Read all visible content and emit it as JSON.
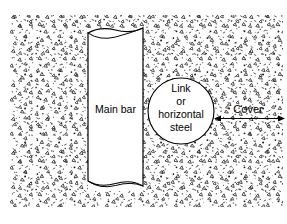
{
  "figure": {
    "type": "engineering-cross-section",
    "background_color": "#ffffff",
    "concrete": {
      "name": "concrete-hatch-region",
      "fill_color": "#ffffff",
      "speck_color": "#1a1a1a",
      "bounds": {
        "x": 10,
        "y": 15,
        "width": 273,
        "height": 192
      }
    },
    "main_bar": {
      "label": "Main bar",
      "fill_color": "#ffffff",
      "stroke_color": "#000000",
      "bounds": {
        "x": 88,
        "y": 28,
        "width": 55,
        "height": 163
      },
      "label_position": {
        "x": 116,
        "y": 109
      }
    },
    "link_steel": {
      "label_lines": [
        "Link",
        "or",
        "horizontal",
        "steel"
      ],
      "fill_color": "#ffffff",
      "stroke_color": "#000000",
      "center": {
        "x": 181,
        "y": 111
      },
      "radius": 33
    },
    "cover": {
      "label": "Cover",
      "label_position": {
        "x": 248,
        "y": 110
      },
      "dimension_line": {
        "x1": 214,
        "x2": 285,
        "y": 118
      },
      "stroke_color": "#000000"
    }
  }
}
